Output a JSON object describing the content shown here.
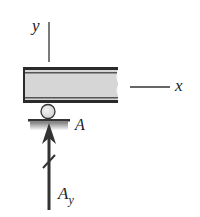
{
  "diagram": {
    "type": "free-body-diagram",
    "axes": {
      "y_label": "y",
      "x_label": "x"
    },
    "support": {
      "type": "roller",
      "point_label": "A"
    },
    "force": {
      "name": "A",
      "subscript": "y",
      "direction": "up"
    },
    "colors": {
      "beam_fill": "#d6d6d6",
      "beam_border": "#2a2a2a",
      "arrow": "#333333",
      "roller_fill": "#e4e4e4",
      "text": "#222222"
    }
  }
}
